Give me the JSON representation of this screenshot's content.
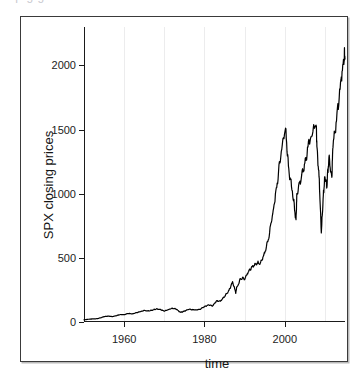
{
  "figure": {
    "top_bleed_text": "a p   g  g",
    "frame_color": "#3a3a3a",
    "background": "#ffffff"
  },
  "chart_data": {
    "type": "line",
    "title": "",
    "subtitle": "",
    "xlabel": "time",
    "ylabel": "SPX closing prices",
    "grid": true,
    "grid_axis": "x",
    "legend": false,
    "legend_position": "none",
    "line_color": "#000000",
    "line_width": 1.2,
    "xlim": [
      1950,
      2015
    ],
    "ylim": [
      0,
      2300
    ],
    "xticks": [
      1960,
      1980,
      2000
    ],
    "xtick_labels": [
      "1960",
      "1980",
      "2000"
    ],
    "yticks": [
      0,
      500,
      1000,
      1500,
      2000
    ],
    "ytick_labels": [
      "0",
      "500",
      "1000",
      "1500",
      "2000"
    ],
    "gridline_x": [
      1950,
      1960,
      1970,
      1980,
      1990,
      2000,
      2010
    ],
    "x": [
      1950,
      1951,
      1952,
      1953,
      1954,
      1955,
      1956,
      1957,
      1958,
      1959,
      1960,
      1961,
      1962,
      1963,
      1964,
      1965,
      1966,
      1967,
      1968,
      1969,
      1970,
      1971,
      1972,
      1973,
      1974,
      1975,
      1976,
      1977,
      1978,
      1979,
      1980,
      1981,
      1982,
      1983,
      1984,
      1985,
      1986,
      1987,
      1987.8,
      1988,
      1989,
      1990,
      1991,
      1992,
      1993,
      1994,
      1995,
      1996,
      1997,
      1998,
      1999,
      2000.2,
      2001,
      2002,
      2002.8,
      2003,
      2004,
      2005,
      2006,
      2007.8,
      2008,
      2008.6,
      2009.1,
      2009.6,
      2010,
      2010.5,
      2011,
      2011.7,
      2012,
      2013,
      2014,
      2014.8,
      2015
    ],
    "y": [
      17,
      21,
      24,
      25,
      31,
      42,
      46,
      42,
      49,
      58,
      57,
      67,
      63,
      72,
      81,
      90,
      86,
      93,
      102,
      98,
      86,
      96,
      107,
      101,
      75,
      84,
      99,
      96,
      94,
      101,
      120,
      132,
      126,
      163,
      163,
      199,
      240,
      310,
      230,
      265,
      338,
      340,
      395,
      430,
      460,
      462,
      540,
      660,
      840,
      1050,
      1320,
      1500,
      1180,
      1000,
      790,
      980,
      1120,
      1220,
      1400,
      1550,
      1370,
      1100,
      700,
      980,
      1130,
      1070,
      1290,
      1120,
      1380,
      1600,
      1880,
      2090,
      2050
    ],
    "annotations": []
  }
}
